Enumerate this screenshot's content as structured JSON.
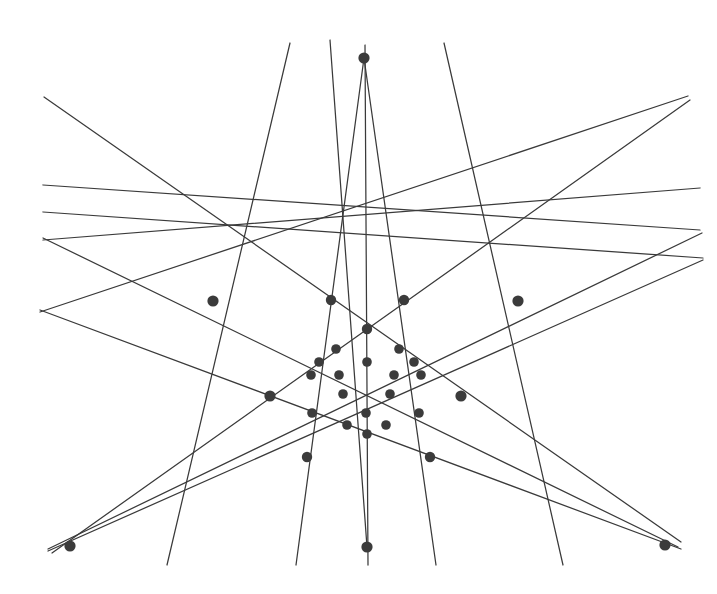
{
  "figure": {
    "kind": "point-line-incidence-configuration",
    "canvas": {
      "width": 717,
      "height": 594,
      "background": "#ffffff"
    },
    "style": {
      "line_color": "#3a3a3a",
      "line_width": 1.25,
      "node_color": "#3b3b3b",
      "node_radius": 5.2,
      "small_node_radius": 4.4
    },
    "counts": {
      "points": 34,
      "lines": 16
    }
  },
  "chart_data": {
    "type": "scatter",
    "xlabel": "",
    "ylabel": "",
    "grid": false,
    "legend": null,
    "xlim": [
      0,
      717
    ],
    "ylim": [
      0,
      594
    ],
    "points": [
      {
        "id": "P-top",
        "name": "top-apex",
        "x": 364,
        "y": 58,
        "r": 5.6
      },
      {
        "id": "P-bottom",
        "name": "bottom-apex",
        "x": 367,
        "y": 547,
        "r": 5.6
      },
      {
        "id": "P-bl",
        "name": "bottom-left-apex",
        "x": 70,
        "y": 546,
        "r": 5.6
      },
      {
        "id": "P-br",
        "name": "bottom-right-apex",
        "x": 665,
        "y": 545,
        "r": 5.6
      },
      {
        "id": "P-lu",
        "name": "left-upper-hub",
        "x": 213,
        "y": 301,
        "r": 5.6
      },
      {
        "id": "P-ru",
        "name": "right-upper-hub",
        "x": 518,
        "y": 301,
        "r": 5.6
      },
      {
        "id": "P-lm",
        "name": "left-mid-hub",
        "x": 270,
        "y": 396,
        "r": 5.6
      },
      {
        "id": "P-rm",
        "name": "right-mid-hub",
        "x": 461,
        "y": 396,
        "r": 5.6
      },
      {
        "id": "P-bln",
        "name": "lower-left-node",
        "x": 307,
        "y": 457,
        "r": 5.2
      },
      {
        "id": "P-brn",
        "name": "lower-right-node",
        "x": 430,
        "y": 457,
        "r": 5.2
      },
      {
        "id": "P-t1",
        "name": "upper-left-node",
        "x": 331,
        "y": 300,
        "r": 5.2
      },
      {
        "id": "P-t2",
        "name": "upper-right-node",
        "x": 404,
        "y": 300,
        "r": 5.2
      },
      {
        "id": "P-c1",
        "name": "upper-center-node",
        "x": 367,
        "y": 329,
        "r": 5.2
      },
      {
        "id": "P-r2a",
        "name": "row2-left",
        "x": 336,
        "y": 349,
        "r": 4.8
      },
      {
        "id": "P-r2b",
        "name": "row2-right",
        "x": 399,
        "y": 349,
        "r": 4.8
      },
      {
        "id": "P-r3a",
        "name": "row3-left",
        "x": 319,
        "y": 362,
        "r": 4.8
      },
      {
        "id": "P-r3b",
        "name": "row3-center",
        "x": 367,
        "y": 362,
        "r": 4.8
      },
      {
        "id": "P-r3c",
        "name": "row3-right",
        "x": 414,
        "y": 362,
        "r": 4.8
      },
      {
        "id": "P-r4a",
        "name": "row4-far-left",
        "x": 311,
        "y": 375,
        "r": 4.8
      },
      {
        "id": "P-r4b",
        "name": "row4-left",
        "x": 339,
        "y": 375,
        "r": 4.8
      },
      {
        "id": "P-r4c",
        "name": "row4-right",
        "x": 394,
        "y": 375,
        "r": 4.8
      },
      {
        "id": "P-r4d",
        "name": "row4-far-right",
        "x": 421,
        "y": 375,
        "r": 4.8
      },
      {
        "id": "P-r5a",
        "name": "row5-left",
        "x": 343,
        "y": 394,
        "r": 4.8
      },
      {
        "id": "P-r5b",
        "name": "row5-right",
        "x": 390,
        "y": 394,
        "r": 4.8
      },
      {
        "id": "P-r6a",
        "name": "row6-left",
        "x": 312,
        "y": 413,
        "r": 4.8
      },
      {
        "id": "P-r6b",
        "name": "row6-center",
        "x": 366,
        "y": 413,
        "r": 4.8
      },
      {
        "id": "P-r6c",
        "name": "row6-right",
        "x": 419,
        "y": 413,
        "r": 4.8
      },
      {
        "id": "P-r7a",
        "name": "row7-left",
        "x": 347,
        "y": 425,
        "r": 4.8
      },
      {
        "id": "P-r7b",
        "name": "row7-right",
        "x": 386,
        "y": 425,
        "r": 4.8
      },
      {
        "id": "P-r8",
        "name": "row8-center",
        "x": 367,
        "y": 434,
        "r": 4.8
      }
    ],
    "lines": [
      {
        "id": "L1",
        "name": "long-diagonal-ul-to-br",
        "x1": 44,
        "y1": 97,
        "x2": 681,
        "y2": 542
      },
      {
        "id": "L2",
        "name": "diagonal-left-to-right-1",
        "x1": 43,
        "y1": 185,
        "x2": 700,
        "y2": 230
      },
      {
        "id": "L3",
        "name": "diagonal-left-to-right-2",
        "x1": 43,
        "y1": 212,
        "x2": 703,
        "y2": 258
      },
      {
        "id": "L4",
        "name": "diagonal-left-to-right-3",
        "x1": 43,
        "y1": 240,
        "x2": 700,
        "y2": 188
      },
      {
        "id": "L5",
        "name": "diagonal-left-to-right-4",
        "x1": 40,
        "y1": 312,
        "x2": 688,
        "y2": 96
      },
      {
        "id": "L6",
        "name": "diagonal-bl-to-ur",
        "x1": 52,
        "y1": 553,
        "x2": 690,
        "y2": 100
      },
      {
        "id": "L7",
        "name": "diagonal-bl-shallow-1",
        "x1": 48,
        "y1": 549,
        "x2": 702,
        "y2": 233
      },
      {
        "id": "L8",
        "name": "diagonal-bl-shallow-2",
        "x1": 48,
        "y1": 551,
        "x2": 703,
        "y2": 260
      },
      {
        "id": "L9",
        "name": "diagonal-br-to-ul",
        "x1": 681,
        "y1": 549,
        "x2": 40,
        "y2": 310
      },
      {
        "id": "L10",
        "name": "diagonal-br-shallow",
        "x1": 678,
        "y1": 547,
        "x2": 43,
        "y2": 238
      },
      {
        "id": "L11",
        "name": "steep-top-to-bl",
        "x1": 290,
        "y1": 43,
        "x2": 167,
        "y2": 565
      },
      {
        "id": "L12",
        "name": "steep-top-to-br",
        "x1": 444,
        "y1": 43,
        "x2": 563,
        "y2": 565
      },
      {
        "id": "L13",
        "name": "apex-left-leg",
        "x1": 364,
        "y1": 58,
        "x2": 296,
        "y2": 565
      },
      {
        "id": "L14",
        "name": "apex-right-leg",
        "x1": 364,
        "y1": 58,
        "x2": 436,
        "y2": 565
      },
      {
        "id": "L15",
        "name": "vertical-axis",
        "x1": 365,
        "y1": 45,
        "x2": 368,
        "y2": 565
      },
      {
        "id": "L16",
        "name": "bottom-apex-to-top-left",
        "x1": 367,
        "y1": 547,
        "x2": 330,
        "y2": 40
      }
    ]
  }
}
